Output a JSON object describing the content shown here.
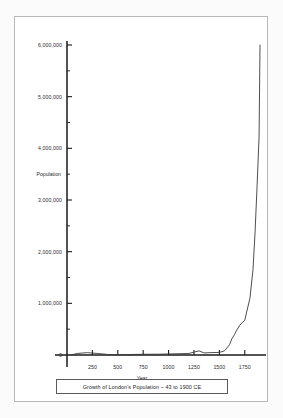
{
  "caption": "Growth of London's Population – 43 to 1900 CE",
  "chart_data": {
    "type": "line",
    "title": "Growth of London's Population – 43 to 1900 CE",
    "xlabel": "Year",
    "ylabel": "Population",
    "xlim": [
      0,
      1900
    ],
    "ylim": [
      0,
      6000000
    ],
    "grid": false,
    "legend": null,
    "x_ticks": [
      250,
      500,
      750,
      1000,
      1250,
      1500,
      1750
    ],
    "x_tick_labels": [
      "250",
      "500",
      "750",
      "1000",
      "1250",
      "1500",
      "1750"
    ],
    "x_minor_step": 125,
    "y_ticks": [
      0,
      1000000,
      2000000,
      3000000,
      4000000,
      5000000,
      6000000
    ],
    "y_tick_labels": [
      "0",
      "1,000,000",
      "2,000,000",
      "3,000,000",
      "4,000,000",
      "5,000,000",
      "6,000,000"
    ],
    "y_minor_step": 500000,
    "line_color": "#3a3a3a",
    "axis_color": "#1a1a1a",
    "series": [
      {
        "name": "London population",
        "x": [
          43,
          100,
          200,
          300,
          400,
          500,
          600,
          700,
          800,
          900,
          1000,
          1100,
          1200,
          1300,
          1350,
          1400,
          1500,
          1550,
          1600,
          1625,
          1650,
          1665,
          1700,
          1750,
          1801,
          1831,
          1851,
          1871,
          1891,
          1900
        ],
        "y": [
          0,
          30000,
          45000,
          30000,
          10000,
          5000,
          8000,
          12000,
          15000,
          15000,
          20000,
          25000,
          30000,
          80000,
          40000,
          45000,
          50000,
          80000,
          200000,
          320000,
          400000,
          460000,
          575000,
          675000,
          1100000,
          1650000,
          2360000,
          3260000,
          4230000,
          6000000
        ]
      }
    ],
    "annotations": []
  }
}
